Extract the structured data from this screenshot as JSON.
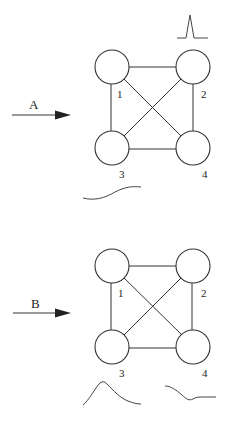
{
  "panels": [
    {
      "id": "A",
      "arrow_label": "A",
      "nodes": [
        {
          "label": "1",
          "cx": 112,
          "cy": 67
        },
        {
          "label": "2",
          "cx": 193,
          "cy": 67
        },
        {
          "label": "3",
          "cx": 112,
          "cy": 148
        },
        {
          "label": "4",
          "cx": 193,
          "cy": 148
        }
      ],
      "edges": [
        [
          "1",
          "2"
        ],
        [
          "1",
          "3"
        ],
        [
          "2",
          "4"
        ],
        [
          "3",
          "4"
        ],
        [
          "1",
          "4"
        ],
        [
          "2",
          "3"
        ]
      ],
      "waveforms": [
        {
          "name": "sharp-peak-near-node-2",
          "shape": "narrow spike"
        },
        {
          "name": "rising-curve-under-node-3",
          "shape": "gentle sigmoid rise"
        }
      ]
    },
    {
      "id": "B",
      "arrow_label": "B",
      "nodes": [
        {
          "label": "1",
          "cx": 112,
          "cy": 266
        },
        {
          "label": "2",
          "cx": 193,
          "cy": 266
        },
        {
          "label": "3",
          "cx": 112,
          "cy": 347
        },
        {
          "label": "4",
          "cx": 193,
          "cy": 347
        }
      ],
      "edges": [
        [
          "1",
          "2"
        ],
        [
          "1",
          "3"
        ],
        [
          "2",
          "4"
        ],
        [
          "3",
          "4"
        ],
        [
          "1",
          "4"
        ],
        [
          "2",
          "3"
        ]
      ],
      "waveforms": [
        {
          "name": "broad-peak-under-node-3",
          "shape": "hump with decaying tail"
        },
        {
          "name": "dip-curve-under-node-4",
          "shape": "falling then flat"
        }
      ]
    }
  ]
}
